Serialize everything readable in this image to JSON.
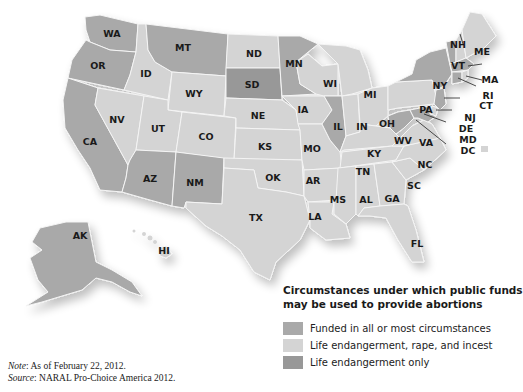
{
  "legend": {
    "title_line1": "Circumstances under which public funds",
    "title_line2": "may be used to provide abortions",
    "items": [
      {
        "label": "Funded in all or most circumstances",
        "color": "#a9a9a9"
      },
      {
        "label": "Life endangerment, rape, and incest",
        "color": "#d4d4d4"
      },
      {
        "label": "Life endangerment only",
        "color": "#989898"
      }
    ]
  },
  "notes": {
    "note_label": "Note",
    "note_text": ": As of February 22, 2012.",
    "source_label": "Source",
    "source_text": ": NARAL Pro-Choice America 2012."
  },
  "states": {
    "funded": [
      "WA",
      "OR",
      "CA",
      "MT",
      "AK",
      "AZ",
      "NM",
      "MN",
      "IL",
      "WV",
      "NY",
      "VT",
      "MA",
      "CT",
      "NJ",
      "MD"
    ],
    "life_rape_incest": [
      "NV",
      "ID",
      "WY",
      "UT",
      "CO",
      "ND",
      "NE",
      "KS",
      "OK",
      "TX",
      "IA",
      "MO",
      "AR",
      "LA",
      "WI",
      "MI",
      "IN",
      "OH",
      "KY",
      "TN",
      "MS",
      "AL",
      "GA",
      "FL",
      "SC",
      "NC",
      "VA",
      "PA",
      "NH",
      "ME",
      "RI",
      "DE",
      "DC",
      "HI"
    ],
    "life_only": [
      "SD"
    ]
  },
  "labels": {
    "WA": "WA",
    "OR": "OR",
    "CA": "CA",
    "ID": "ID",
    "NV": "NV",
    "MT": "MT",
    "WY": "WY",
    "UT": "UT",
    "CO": "CO",
    "AZ": "AZ",
    "NM": "NM",
    "ND": "ND",
    "SD": "SD",
    "NE": "NE",
    "KS": "KS",
    "OK": "OK",
    "TX": "TX",
    "MN": "MN",
    "IA": "IA",
    "MO": "MO",
    "AR": "AR",
    "LA": "LA",
    "WI": "WI",
    "IL": "IL",
    "MI": "MI",
    "IN": "IN",
    "OH": "OH",
    "KY": "KY",
    "TN": "TN",
    "MS": "MS",
    "AL": "AL",
    "GA": "GA",
    "FL": "FL",
    "SC": "SC",
    "NC": "NC",
    "VA": "VA",
    "WV": "WV",
    "PA": "PA",
    "NY": "NY",
    "VT": "VT",
    "NH": "NH",
    "ME": "ME",
    "MA": "MA",
    "RI": "RI",
    "CT": "CT",
    "NJ": "NJ",
    "DE": "DE",
    "MD": "MD",
    "DC": "DC",
    "AK": "AK",
    "HI": "HI"
  }
}
